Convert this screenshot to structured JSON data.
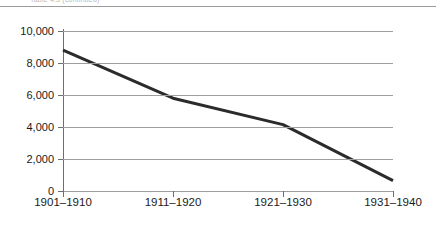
{
  "figure": {
    "clipped_caption": "Table 4.3 (continued)",
    "rule_color": "#9b9b9b"
  },
  "colors": {
    "line": "#2b2b2b",
    "gridline": "#9e9e9e",
    "axis": "#6e6e6e",
    "text": "#1a1a1a",
    "background": "#ffffff"
  },
  "chart_data": {
    "type": "line",
    "title": "",
    "xlabel": "",
    "ylabel": "",
    "categories": [
      "1901–1910",
      "1911–1920",
      "1921–1930",
      "1931–1940"
    ],
    "values": [
      8800,
      5800,
      4150,
      650
    ],
    "series": [
      {
        "name": "",
        "values": [
          8800,
          5800,
          4150,
          650
        ]
      }
    ],
    "ylim": [
      0,
      10000
    ],
    "yticks": [
      0,
      2000,
      4000,
      6000,
      8000,
      10000
    ],
    "ytick_labels": [
      "0",
      "2,000",
      "4,000",
      "6,000",
      "8,000",
      "10,000"
    ],
    "xtick_labels": [
      "1901–1910",
      "1911–1920",
      "1921–1930",
      "1931–1940"
    ],
    "grid": true,
    "grid_axis": "y",
    "legend": false,
    "legend_position": "none",
    "markers": false,
    "line_width_px": 3
  }
}
